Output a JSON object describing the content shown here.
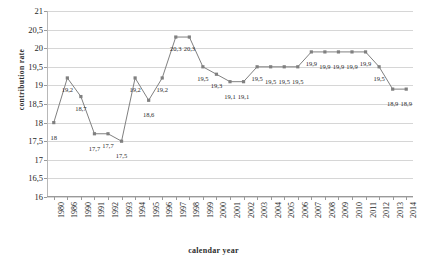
{
  "chart_data": {
    "type": "line",
    "title": "",
    "xlabel": "calendar year",
    "ylabel": "contribution  rate",
    "ylim": [
      16,
      21
    ],
    "ytick_step": 0.5,
    "grid": true,
    "legend": "none",
    "decimal_separator": ",",
    "series_color": "#808080",
    "marker": "square",
    "categories": [
      "1980",
      "1986",
      "1990",
      "1991",
      "1992",
      "1993",
      "1994",
      "1995",
      "1996",
      "1997",
      "1998",
      "1999",
      "2000",
      "2001",
      "2002",
      "2003",
      "2004",
      "2005",
      "2006",
      "2007",
      "2008",
      "2009",
      "2010",
      "2011",
      "2012",
      "2013",
      "2014"
    ],
    "values": [
      18,
      19.2,
      18.7,
      17.7,
      17.7,
      17.5,
      19.2,
      18.6,
      19.2,
      20.3,
      20.3,
      19.5,
      19.3,
      19.1,
      19.1,
      19.5,
      19.5,
      19.5,
      19.5,
      19.9,
      19.9,
      19.9,
      19.9,
      19.9,
      19.5,
      18.9,
      18.9
    ],
    "point_labels": [
      "18",
      "19,2",
      "18,7",
      "17,7",
      "17,7",
      "17,5",
      "19,2",
      "18,6",
      "19,2",
      "20,3",
      "20,3",
      "19,5",
      "19,3",
      "19,1",
      "19,1",
      "19,5",
      "19,5",
      "19,5",
      "19,5",
      "19,9",
      "19,9",
      "19,9",
      "19,9",
      "19,9",
      "19,5",
      "18,9",
      "18,9"
    ],
    "ytick_labels": [
      "21",
      "20,5",
      "20",
      "19,5",
      "19",
      "18,5",
      "18",
      "17,5",
      "17",
      "16,5",
      "16"
    ],
    "ytick_values": [
      21,
      20.5,
      20,
      19.5,
      19,
      18.5,
      18,
      17.5,
      17,
      16.5,
      16
    ]
  }
}
